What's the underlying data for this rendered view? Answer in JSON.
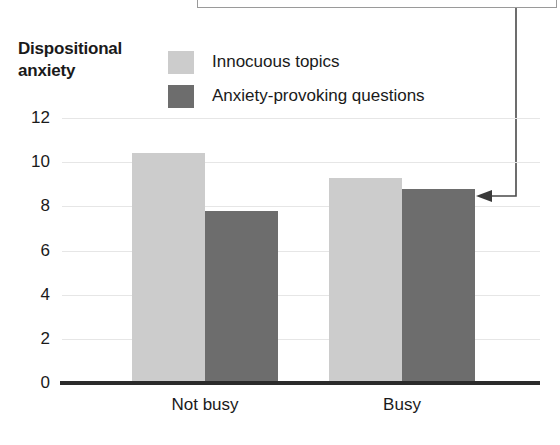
{
  "figure": {
    "background": "#ffffff",
    "width": 560,
    "height": 445
  },
  "annotation": {
    "callout_box": {
      "name": "callout-box",
      "border_color": "#9a9a9a",
      "visible_portion": "bottom-edge-only"
    },
    "leader_line": {
      "name": "leader-line",
      "color": "#4a4a4a",
      "points_to": "Busy / Anxiety-provoking questions bar"
    }
  },
  "chart_data": {
    "type": "bar",
    "title": "Dispositional anxiety",
    "title_lines": [
      "Dispositional",
      "anxiety"
    ],
    "xlabel": "",
    "ylabel": "Dispositional anxiety",
    "categories": [
      "Not busy",
      "Busy"
    ],
    "series": [
      {
        "name": "Innocuous topics",
        "color": "#cccccc",
        "values": [
          10.4,
          9.3
        ]
      },
      {
        "name": "Anxiety-provoking questions",
        "color": "#6d6d6d",
        "values": [
          7.8,
          8.8
        ]
      }
    ],
    "ylim": [
      0,
      12
    ],
    "yticks": [
      0,
      2,
      4,
      6,
      8,
      10,
      12
    ],
    "ytick_labels": [
      "0",
      "2",
      "4",
      "6",
      "8",
      "10",
      "12"
    ],
    "grid": true,
    "grid_color": "#e6e6e6",
    "legend_position": "top-center",
    "axis_color": "#2b2b2b"
  }
}
